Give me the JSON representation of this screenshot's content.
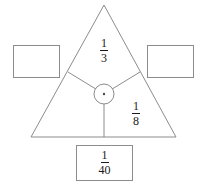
{
  "diagram": {
    "type": "triangle-node-diagram",
    "stroke_color": "#8c8c8c",
    "text_color": "#1a1a1a",
    "background": "#ffffff",
    "triangle": {
      "apex": [
        104,
        5
      ],
      "bottom_left": [
        31,
        137
      ],
      "bottom_right": [
        176,
        137
      ]
    },
    "center_node": {
      "center": [
        104,
        94
      ],
      "radius": 10,
      "dot_radius": 1.2
    },
    "branches": [
      {
        "name": "upper-left-branch",
        "from": [
          104,
          94
        ],
        "to": [
          68,
          72
        ]
      },
      {
        "name": "upper-right-branch",
        "from": [
          104,
          94
        ],
        "to": [
          140,
          72
        ]
      },
      {
        "name": "bottom-branch",
        "from": [
          104,
          94
        ],
        "to": [
          104,
          137
        ]
      }
    ]
  },
  "labels": {
    "top_fraction": {
      "numerator": "1",
      "denominator": "3"
    },
    "right_fraction": {
      "numerator": "1",
      "denominator": "8"
    }
  },
  "boxes": {
    "left": {
      "value": "",
      "numerator": "",
      "denominator": ""
    },
    "right": {
      "value": "",
      "numerator": "",
      "denominator": ""
    },
    "bottom": {
      "numerator": "1",
      "denominator": "40"
    }
  }
}
